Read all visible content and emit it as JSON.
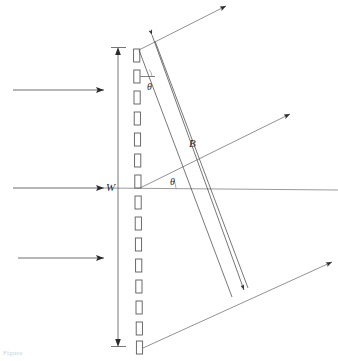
{
  "figure": {
    "kind": "optics-diagram",
    "background_color": "#ffffff",
    "line_color": "#4a4a4a",
    "slit_color": "#5a5a5a",
    "label_color": "#2b2b2b",
    "caption_color": "#d0d0d0",
    "labels": {
      "width": "W",
      "beam": "B",
      "theta_top": "θ",
      "theta_center": "θ"
    },
    "caption": "Figure",
    "grating": {
      "slit_count": 15,
      "slit_label": "grating-slit"
    },
    "rays": {
      "incoming_top": "incoming ray",
      "incoming_bottom": "incoming ray",
      "incoming_center": "incoming ray",
      "outgoing_top": "diffracted ray",
      "outgoing_center": "diffracted ray",
      "outgoing_bottom": "diffracted ray"
    },
    "dimensions": {
      "w_line": "grating width dimension",
      "b_line": "diffracted beam width dimension"
    }
  }
}
